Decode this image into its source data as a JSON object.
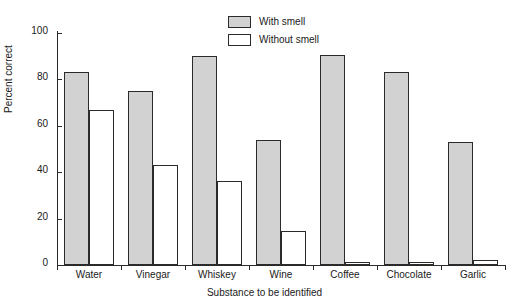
{
  "chart_data": {
    "type": "bar",
    "title": "",
    "xlabel": "Substance to be identified",
    "ylabel": "Percent correct",
    "categories": [
      "Water",
      "Vinegar",
      "Whiskey",
      "Wine",
      "Coffee",
      "Chocolate",
      "Garlic"
    ],
    "series": [
      {
        "name": "With smell",
        "color": "#d2d2d2",
        "values": [
          83,
          75,
          90,
          54,
          90.5,
          83,
          53
        ]
      },
      {
        "name": "Without smell",
        "color": "#ffffff",
        "values": [
          67,
          43,
          36,
          14.5,
          1.5,
          1.5,
          2
        ]
      }
    ],
    "ylim": [
      0,
      100
    ],
    "yticks": [
      0,
      20,
      40,
      60,
      80,
      100
    ],
    "ytick_labels": [
      "0",
      "20",
      "40",
      "60",
      "80",
      "100"
    ],
    "grid": false,
    "legend_position": "top-center"
  },
  "legend": {
    "items": [
      {
        "label": "With smell"
      },
      {
        "label": "Without smell"
      }
    ]
  },
  "colors": {
    "with_smell_fill": "#d2d2d2",
    "without_smell_fill": "#ffffff",
    "axis": "#2b2b2b",
    "background": "#ffffff"
  }
}
